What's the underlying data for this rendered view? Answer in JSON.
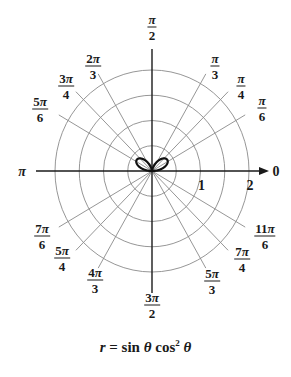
{
  "chart_data": {
    "type": "line",
    "subtype": "polar",
    "equation": {
      "r_var": "r",
      "equals": "=",
      "term1": "sin",
      "theta": "θ",
      "term2": "cos",
      "exponent": "2"
    },
    "radial_rings": [
      0.5,
      1,
      1.5,
      2
    ],
    "radial_tick_labels": [
      {
        "value": 1,
        "label": "1"
      },
      {
        "value": 2,
        "label": "2"
      }
    ],
    "angle_labels": [
      {
        "angle_deg": 0,
        "text": "0"
      },
      {
        "angle_deg": 30,
        "num": "π",
        "den": "6"
      },
      {
        "angle_deg": 45,
        "num": "π",
        "den": "4"
      },
      {
        "angle_deg": 60,
        "num": "π",
        "den": "3"
      },
      {
        "angle_deg": 90,
        "num": "π",
        "den": "2"
      },
      {
        "angle_deg": 120,
        "num": "2π",
        "den": "3"
      },
      {
        "angle_deg": 135,
        "num": "3π",
        "den": "4"
      },
      {
        "angle_deg": 150,
        "num": "5π",
        "den": "6"
      },
      {
        "angle_deg": 180,
        "text": "π"
      },
      {
        "angle_deg": 210,
        "num": "7π",
        "den": "6"
      },
      {
        "angle_deg": 225,
        "num": "5π",
        "den": "4"
      },
      {
        "angle_deg": 240,
        "num": "4π",
        "den": "3"
      },
      {
        "angle_deg": 270,
        "num": "3π",
        "den": "2"
      },
      {
        "angle_deg": 300,
        "num": "5π",
        "den": "3"
      },
      {
        "angle_deg": 315,
        "num": "7π",
        "den": "4"
      },
      {
        "angle_deg": 330,
        "num": "11π",
        "den": "6"
      }
    ],
    "spoke_angles_deg": [
      30,
      45,
      60,
      120,
      135,
      150,
      210,
      225,
      240,
      300,
      315,
      330
    ],
    "curve": {
      "formula": "r = sin(theta) * cos(theta)^2",
      "theta_range": [
        0,
        3.14159
      ],
      "max_r": 0.385,
      "max_r_angles_deg": [
        35.3,
        144.7
      ],
      "sample_points": [
        {
          "theta_deg": 0,
          "r": 0
        },
        {
          "theta_deg": 15,
          "r": 0.241
        },
        {
          "theta_deg": 30,
          "r": 0.375
        },
        {
          "theta_deg": 35.3,
          "r": 0.385
        },
        {
          "theta_deg": 45,
          "r": 0.354
        },
        {
          "theta_deg": 60,
          "r": 0.217
        },
        {
          "theta_deg": 75,
          "r": 0.065
        },
        {
          "theta_deg": 90,
          "r": 0
        },
        {
          "theta_deg": 105,
          "r": 0.065
        },
        {
          "theta_deg": 120,
          "r": 0.217
        },
        {
          "theta_deg": 135,
          "r": 0.354
        },
        {
          "theta_deg": 144.7,
          "r": 0.385
        },
        {
          "theta_deg": 150,
          "r": 0.375
        },
        {
          "theta_deg": 165,
          "r": 0.241
        },
        {
          "theta_deg": 180,
          "r": 0
        }
      ]
    },
    "rmax_display": 2,
    "grid": true,
    "legend": null
  },
  "colors": {
    "axis": "#1a1a1a",
    "grid": "#8a8a8a",
    "curve": "#111111",
    "text": "#1a1a1a"
  }
}
